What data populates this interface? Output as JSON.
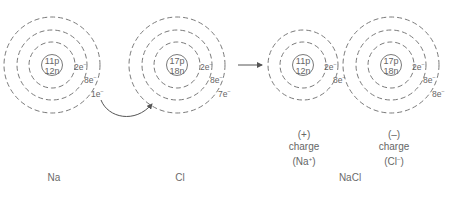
{
  "diagram": {
    "atoms": [
      {
        "id": "na",
        "label": "Na",
        "nucleus": {
          "protons": "11p",
          "neutrons": "12n"
        },
        "shells": [
          {
            "count": "2e"
          },
          {
            "count": "8e"
          },
          {
            "count": "1e"
          }
        ]
      },
      {
        "id": "cl",
        "label": "Cl",
        "nucleus": {
          "protons": "17p",
          "neutrons": "18n"
        },
        "shells": [
          {
            "count": "2e"
          },
          {
            "count": "8e"
          },
          {
            "count": "7e"
          }
        ]
      }
    ],
    "product": {
      "label": "NaCl",
      "ions": [
        {
          "id": "na_ion",
          "nucleus": {
            "protons": "11p",
            "neutrons": "12n"
          },
          "shells": [
            {
              "count": "2e"
            },
            {
              "count": "8e"
            }
          ],
          "sign": "(+)",
          "charge_word": "charge",
          "ion_name": "(Na",
          "ion_sup": "+",
          "ion_close": ")"
        },
        {
          "id": "cl_ion",
          "nucleus": {
            "protons": "17p",
            "neutrons": "18n"
          },
          "shells": [
            {
              "count": "2e"
            },
            {
              "count": "8e"
            },
            {
              "count": "8e"
            }
          ],
          "sign": "(–)",
          "charge_word": "charge",
          "ion_name": "(Cl",
          "ion_sup": "–",
          "ion_close": ")"
        }
      ]
    },
    "electron_sup": "–",
    "colors": {
      "stroke": "#777777",
      "text": "#666666",
      "background": "#ffffff"
    }
  }
}
